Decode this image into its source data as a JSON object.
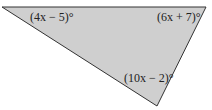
{
  "figure": {
    "type": "triangle",
    "fill_color": "#cfcfcf",
    "stroke_color": "#333333",
    "vertices": {
      "top_left": [
        2,
        7
      ],
      "top_right": [
        206,
        7
      ],
      "bottom": [
        157,
        106
      ]
    },
    "angles": [
      {
        "vertex": "top_left",
        "label": "(4x − 5)°"
      },
      {
        "vertex": "top_right",
        "label": "(6x + 7)°"
      },
      {
        "vertex": "bottom",
        "label": "(10x − 2)°"
      }
    ]
  }
}
